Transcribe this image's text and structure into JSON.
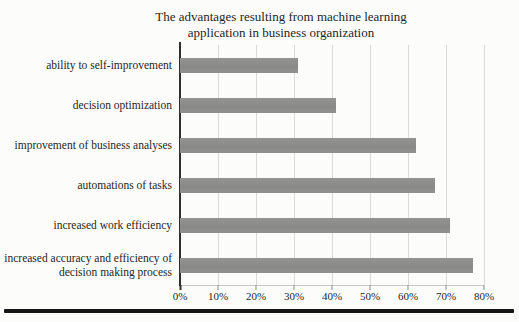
{
  "chart_data": {
    "type": "bar",
    "orientation": "horizontal",
    "title": "The advantages resulting from machine learning application in business organization",
    "title_lines": [
      "The advantages resulting from machine learning",
      "application in business organization"
    ],
    "categories": [
      "ability to self-improvement",
      "decision optimization",
      "improvement of business analyses",
      "automations of tasks",
      "increased work efficiency",
      "increased accuracy and efficiency of decision making process"
    ],
    "values": [
      31,
      41,
      62,
      67,
      71,
      77
    ],
    "unit": "%",
    "xlim": [
      0,
      80
    ],
    "x_ticks": [
      "0%",
      "10%",
      "20%",
      "30%",
      "40%",
      "50%",
      "60%",
      "70%",
      "80%"
    ],
    "xlabel": "",
    "ylabel": "",
    "grid": "vertical",
    "legend": "none",
    "bar_color": "#8d8d8d",
    "gridline_color": "#dadad6",
    "axis_color": "#2e2e2e"
  }
}
